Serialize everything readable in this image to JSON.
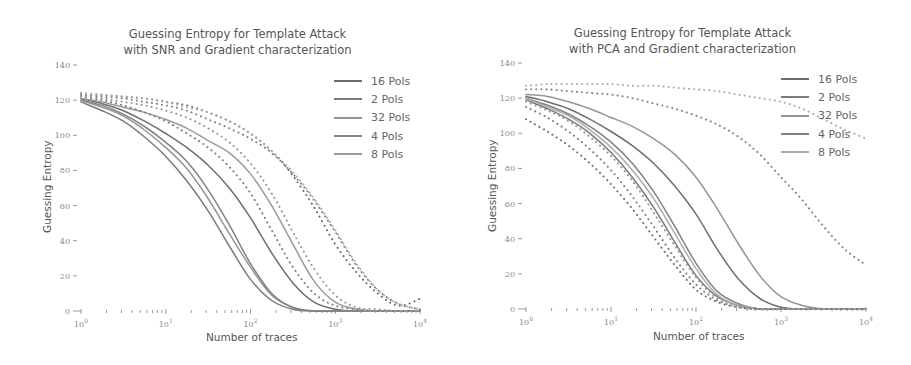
{
  "chart_data": [
    {
      "type": "line",
      "title": "Guessing Entropy for Template Attack with SNR and Gradient characterization",
      "title_lines": [
        "Guessing Entropy for Template Attack",
        "with SNR and Gradient characterization"
      ],
      "xlabel": "Number of traces",
      "ylabel": "Guessing Entropy",
      "xscale": "log",
      "xlim": [
        1,
        10000
      ],
      "ylim": [
        0,
        140
      ],
      "xticks": [
        "10^0",
        "10^1",
        "10^2",
        "10^3",
        "10^4"
      ],
      "yticks": [
        0,
        20,
        40,
        60,
        80,
        100,
        120,
        140
      ],
      "grid": false,
      "legend_position": "upper right",
      "legend": [
        "16 Pols",
        "2 Pols",
        "32 Pols",
        "4 Pols",
        "8 Pols"
      ],
      "log10_x": [
        0,
        0.25,
        0.5,
        0.75,
        1.0,
        1.25,
        1.5,
        1.75,
        2.0,
        2.25,
        2.5,
        2.75,
        3.0,
        3.25,
        3.5,
        3.75,
        4.0
      ],
      "series": [
        {
          "name": "16 Pols",
          "style": "solid",
          "color": "#6e6e6e",
          "values": [
            121,
            118,
            114,
            108,
            101,
            93,
            83,
            70,
            53,
            33,
            16,
            5,
            1,
            0,
            0,
            0,
            0
          ]
        },
        {
          "name": "2 Pols",
          "style": "solid",
          "color": "#7a7a7a",
          "values": [
            119,
            114,
            108,
            99,
            88,
            74,
            57,
            37,
            18,
            6,
            1,
            0,
            0,
            0,
            0,
            0,
            0
          ]
        },
        {
          "name": "32 Pols",
          "style": "solid",
          "color": "#959595",
          "values": [
            120,
            116,
            111,
            103,
            93,
            81,
            64,
            44,
            25,
            9,
            2,
            0,
            0,
            0,
            0,
            0,
            0
          ]
        },
        {
          "name": "4 Pols",
          "style": "solid",
          "color": "#828282",
          "values": [
            120,
            117,
            112,
            105,
            96,
            85,
            69,
            49,
            27,
            10,
            2,
            0,
            0,
            0,
            0,
            0,
            0
          ]
        },
        {
          "name": "8 Pols",
          "style": "solid",
          "color": "#9a9a9a",
          "values": [
            121,
            119,
            116,
            113,
            109,
            104,
            97,
            90,
            78,
            60,
            38,
            17,
            5,
            1,
            0,
            0,
            0
          ]
        },
        {
          "name": "16 Pols (dotted)",
          "style": "dotted",
          "color": "#6e6e6e",
          "values": [
            124,
            123,
            122,
            121,
            119,
            117,
            113,
            108,
            101,
            91,
            77,
            59,
            38,
            22,
            10,
            3,
            7
          ]
        },
        {
          "name": "2 Pols (dotted)",
          "style": "dotted",
          "color": "#7d7d7d",
          "values": [
            122,
            120,
            117,
            113,
            108,
            101,
            93,
            82,
            67,
            46,
            25,
            10,
            3,
            1,
            0,
            0,
            0
          ]
        },
        {
          "name": "32 Pols (dotted)",
          "style": "dotted",
          "color": "#959595",
          "values": [
            122,
            121,
            119,
            117,
            114,
            110,
            104,
            96,
            84,
            67,
            45,
            24,
            9,
            2,
            1,
            0,
            0
          ]
        },
        {
          "name": "4 Pols (dotted)",
          "style": "dotted",
          "color": "#828282",
          "values": [
            123,
            122,
            121,
            119,
            117,
            114,
            109,
            104,
            98,
            90,
            78,
            63,
            45,
            26,
            12,
            4,
            1
          ]
        },
        {
          "name": "8 Pols (dotted)",
          "style": "dotted",
          "color": "#aaaaaa",
          "values": [
            124,
            123,
            122,
            121,
            119,
            116,
            113,
            108,
            101,
            91,
            79,
            64,
            46,
            27,
            12,
            4,
            1
          ]
        }
      ]
    },
    {
      "type": "line",
      "title": "Guessing Entropy for Template Attack with PCA and Gradient characterization",
      "title_lines": [
        "Guessing Entropy for Template Attack",
        "with PCA and Gradient characterization"
      ],
      "xlabel": "Number of traces",
      "ylabel": "Guessing Entropy",
      "xscale": "log",
      "xlim": [
        1,
        10000
      ],
      "ylim": [
        0,
        140
      ],
      "xticks": [
        "10^0",
        "10^1",
        "10^2",
        "10^3",
        "10^4"
      ],
      "yticks": [
        0,
        20,
        40,
        60,
        80,
        100,
        120,
        140
      ],
      "grid": false,
      "legend_position": "upper right",
      "legend": [
        "16 Pols",
        "2 Pols",
        "32 Pols",
        "4 Pols",
        "8 Pols"
      ],
      "log10_x": [
        0,
        0.25,
        0.5,
        0.75,
        1.0,
        1.25,
        1.5,
        1.75,
        2.0,
        2.25,
        2.5,
        2.75,
        3.0,
        3.25,
        3.5,
        3.75,
        4.0
      ],
      "series": [
        {
          "name": "16 Pols",
          "style": "solid",
          "color": "#6e6e6e",
          "values": [
            121,
            118,
            114,
            108,
            101,
            93,
            83,
            70,
            54,
            34,
            17,
            6,
            1,
            0,
            0,
            0,
            0
          ]
        },
        {
          "name": "2 Pols",
          "style": "solid",
          "color": "#7a7a7a",
          "values": [
            119,
            114,
            108,
            100,
            89,
            75,
            58,
            38,
            19,
            7,
            2,
            0,
            0,
            0,
            0,
            0,
            0
          ]
        },
        {
          "name": "32 Pols",
          "style": "solid",
          "color": "#959595",
          "values": [
            122,
            121,
            118,
            114,
            109,
            104,
            97,
            88,
            75,
            57,
            37,
            19,
            7,
            2,
            0,
            0,
            0
          ]
        },
        {
          "name": "4 Pols",
          "style": "solid",
          "color": "#828282",
          "values": [
            120,
            116,
            111,
            104,
            95,
            83,
            67,
            47,
            26,
            10,
            3,
            0,
            0,
            0,
            0,
            0,
            0
          ]
        },
        {
          "name": "8 Pols",
          "style": "solid",
          "color": "#aaaaaa",
          "values": [
            120,
            115,
            110,
            102,
            92,
            79,
            63,
            43,
            23,
            8,
            2,
            0,
            0,
            0,
            0,
            0,
            0
          ]
        },
        {
          "name": "16 Pols (dotted)",
          "style": "dotted",
          "color": "#6e6e6e",
          "values": [
            108,
            101,
            93,
            83,
            71,
            57,
            41,
            25,
            11,
            4,
            1,
            0,
            0,
            0,
            0,
            0,
            0
          ]
        },
        {
          "name": "2 Pols (dotted)",
          "style": "dotted",
          "color": "#7d7d7d",
          "values": [
            115,
            109,
            101,
            91,
            79,
            64,
            47,
            29,
            14,
            5,
            1,
            0,
            0,
            0,
            0,
            0,
            0
          ]
        },
        {
          "name": "32 Pols (dotted)",
          "style": "dotted",
          "color": "#959595",
          "values": [
            118,
            113,
            107,
            98,
            87,
            73,
            55,
            36,
            18,
            6,
            1,
            0,
            0,
            0,
            0,
            0,
            0
          ]
        },
        {
          "name": "4 Pols (dotted)",
          "style": "dotted",
          "color": "#828282",
          "values": [
            125,
            125,
            124,
            123,
            122,
            120,
            117,
            114,
            110,
            105,
            98,
            88,
            75,
            62,
            47,
            34,
            25
          ]
        },
        {
          "name": "8 Pols (dotted)",
          "style": "dotted",
          "color": "#aaaaaa",
          "values": [
            127,
            128,
            128,
            128,
            128,
            127,
            127,
            126,
            125,
            124,
            122,
            120,
            118,
            114,
            108,
            102,
            97
          ]
        }
      ]
    }
  ]
}
